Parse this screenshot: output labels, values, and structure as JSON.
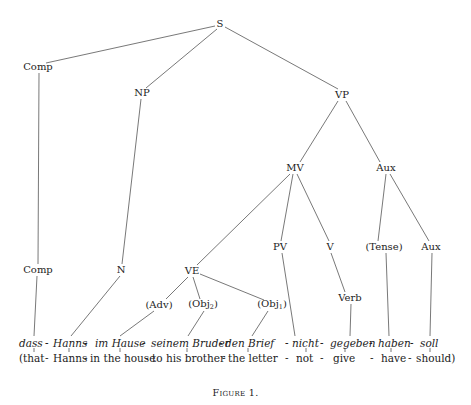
{
  "figure": {
    "caption": "Figure 1.",
    "line_color": "#555555",
    "text_color": "#222222"
  },
  "nodes": {
    "S": {
      "label": "S",
      "x": 220,
      "y": 24
    },
    "Comp1": {
      "label": "Comp",
      "x": 38,
      "y": 67
    },
    "NP": {
      "label": "NP",
      "x": 142,
      "y": 93
    },
    "VP": {
      "label": "VP",
      "x": 342,
      "y": 95
    },
    "MV": {
      "label": "MV",
      "x": 295,
      "y": 168
    },
    "Aux1": {
      "label": "Aux",
      "x": 386,
      "y": 168
    },
    "Comp2": {
      "label": "Comp",
      "x": 38,
      "y": 270
    },
    "N": {
      "label": "N",
      "x": 121,
      "y": 270
    },
    "VE": {
      "label": "VE",
      "x": 192,
      "y": 271
    },
    "PV": {
      "label": "PV",
      "x": 280,
      "y": 247
    },
    "V": {
      "label": "V",
      "x": 330,
      "y": 247
    },
    "Tense": {
      "label": "(Tense)",
      "x": 384,
      "y": 247
    },
    "Aux2": {
      "label": "Aux",
      "x": 431,
      "y": 247
    },
    "Adv": {
      "label": "(Adv)",
      "x": 159,
      "y": 305
    },
    "Obj2": {
      "label": "(Obj",
      "sub": "2",
      "x": 203,
      "y": 305
    },
    "Obj1": {
      "label": "(Obj",
      "sub": "1",
      "x": 272,
      "y": 305
    },
    "Verb": {
      "label": "Verb",
      "x": 350,
      "y": 298
    }
  },
  "german_line": {
    "y": 343,
    "words": [
      {
        "text": "dass",
        "x": 19
      },
      {
        "text": "-",
        "x": 45
      },
      {
        "text": "Hanns",
        "x": 53
      },
      {
        "text": "-",
        "x": 84
      },
      {
        "text": "im Hause",
        "x": 95
      },
      {
        "text": "-",
        "x": 142
      },
      {
        "text": "seinem Bruder",
        "x": 151
      },
      {
        "text": "-",
        "x": 219
      },
      {
        "text": "den Brief",
        "x": 225
      },
      {
        "text": "- nicht",
        "x": 285
      },
      {
        "text": "-",
        "x": 320
      },
      {
        "text": "gegeben",
        "x": 330
      },
      {
        "text": "-",
        "x": 369
      },
      {
        "text": "haben",
        "x": 378
      },
      {
        "text": "-",
        "x": 410
      },
      {
        "text": "soll",
        "x": 420
      }
    ]
  },
  "gloss_line": {
    "y": 358,
    "words": [
      {
        "text": "(that",
        "x": 19
      },
      {
        "text": "-",
        "x": 45
      },
      {
        "text": "Hanns",
        "x": 53
      },
      {
        "text": "-",
        "x": 84
      },
      {
        "text": "in the house",
        "x": 90
      },
      {
        "text": "-",
        "x": 145
      },
      {
        "text": "to his brother",
        "x": 152
      },
      {
        "text": "-",
        "x": 222
      },
      {
        "text": "the letter",
        "x": 228
      },
      {
        "text": "-",
        "x": 285
      },
      {
        "text": "not",
        "x": 296
      },
      {
        "text": "-",
        "x": 320
      },
      {
        "text": "give",
        "x": 333
      },
      {
        "text": "-",
        "x": 370
      },
      {
        "text": "have",
        "x": 381
      },
      {
        "text": "-",
        "x": 408
      },
      {
        "text": "should)",
        "x": 416
      }
    ]
  },
  "edges": [
    [
      "S",
      "Comp1"
    ],
    [
      "S",
      "NP"
    ],
    [
      "S",
      "VP"
    ],
    [
      "VP",
      "MV"
    ],
    [
      "VP",
      "Aux1"
    ],
    [
      "Comp1",
      "Comp2"
    ],
    [
      "NP",
      "N"
    ],
    [
      "MV",
      "VE"
    ],
    [
      "MV",
      "PV"
    ],
    [
      "MV",
      "V"
    ],
    [
      "Aux1",
      "Tense"
    ],
    [
      "Aux1",
      "Aux2"
    ],
    [
      "VE",
      "Adv"
    ],
    [
      "VE",
      "Obj2"
    ],
    [
      "VE",
      "Obj1"
    ],
    [
      "V",
      "Verb"
    ]
  ]
}
